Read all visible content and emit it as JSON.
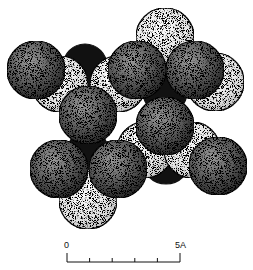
{
  "figure": {
    "type": "sphere-packing-structure",
    "background": "#ffffff",
    "sphere_radius": 29,
    "layers": [
      {
        "name": "black-spheres",
        "fill": "#111111",
        "spheres": [
          {
            "cx": 85,
            "cy": 66,
            "r": 22
          },
          {
            "cx": 165,
            "cy": 62,
            "r": 22
          },
          {
            "cx": 165,
            "cy": 92,
            "r": 22
          },
          {
            "cx": 88,
            "cy": 150,
            "r": 20
          },
          {
            "cx": 166,
            "cy": 160,
            "r": 24
          }
        ]
      },
      {
        "name": "light-spheres",
        "fill": "#e8e8e8",
        "spheres": [
          {
            "cx": 165,
            "cy": 37,
            "r": 29
          },
          {
            "cx": 60,
            "cy": 84,
            "r": 28
          },
          {
            "cx": 118,
            "cy": 84,
            "r": 28
          },
          {
            "cx": 215,
            "cy": 82,
            "r": 29
          },
          {
            "cx": 145,
            "cy": 150,
            "r": 28
          },
          {
            "cx": 192,
            "cy": 150,
            "r": 28
          },
          {
            "cx": 88,
            "cy": 200,
            "r": 29
          }
        ]
      },
      {
        "name": "dark-spheres",
        "fill": "#4a4a4a",
        "spheres": [
          {
            "cx": 36,
            "cy": 70,
            "r": 29
          },
          {
            "cx": 137,
            "cy": 70,
            "r": 29
          },
          {
            "cx": 195,
            "cy": 70,
            "r": 29
          },
          {
            "cx": 88,
            "cy": 115,
            "r": 29
          },
          {
            "cx": 165,
            "cy": 126,
            "r": 29
          },
          {
            "cx": 59,
            "cy": 169,
            "r": 29
          },
          {
            "cx": 118,
            "cy": 169,
            "r": 29
          },
          {
            "cx": 218,
            "cy": 166,
            "r": 29
          }
        ]
      }
    ]
  },
  "scale_bar": {
    "start_label": "0",
    "end_label": "5A",
    "ticks": 6,
    "x_start": 67,
    "x_end": 180,
    "y": 262
  }
}
